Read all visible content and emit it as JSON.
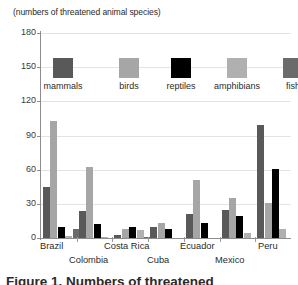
{
  "units_caption": "(numbers of threatened animal species)",
  "bottom_caption": "Figure 1. Numbers of threatened",
  "legend": {
    "items": [
      {
        "label": "mammals",
        "color": "#595959"
      },
      {
        "label": "birds",
        "color": "#a6a6a6"
      },
      {
        "label": "reptiles",
        "color": "#000000"
      },
      {
        "label": "amphibians",
        "color": "#b0b0b0"
      },
      {
        "label": "fish",
        "color": "#6b6b6b"
      }
    ]
  },
  "axis": {
    "y_ticks": [
      "0",
      "30",
      "60",
      "90",
      "120",
      "150",
      "180"
    ],
    "y_min": 0,
    "y_max": 180
  },
  "chart_data": {
    "type": "bar",
    "title": "",
    "subtitle": "(numbers of threatened animal species)",
    "xlabel": "",
    "ylabel": "",
    "ylim": [
      0,
      180
    ],
    "ytick_step": 30,
    "grid": true,
    "legend_position": "inside-top",
    "categories": [
      "Brazil",
      "Colombia",
      "Costa Rica",
      "Cuba",
      "Ecuador",
      "Mexico",
      "Peru"
    ],
    "series": [
      {
        "name": "mammals",
        "color": "#595959",
        "values": [
          45,
          24,
          3,
          10,
          21,
          25,
          99
        ]
      },
      {
        "name": "birds",
        "color": "#a6a6a6",
        "values": [
          103,
          62,
          8,
          13,
          51,
          35,
          31
        ]
      },
      {
        "name": "reptiles",
        "color": "#000000",
        "values": [
          10,
          12,
          10,
          8,
          13,
          19,
          61
        ]
      },
      {
        "name": "amphibians",
        "color": "#b0b0b0",
        "values": [
          2,
          1,
          7,
          0,
          0,
          4,
          8
        ]
      },
      {
        "name": "fish",
        "color": "#6b6b6b",
        "values": [
          8,
          0,
          1,
          0,
          0,
          0,
          0
        ]
      }
    ]
  },
  "x_labels": [
    {
      "text": "Brazil",
      "row": 1,
      "left": 40
    },
    {
      "text": "Colombia",
      "row": 2,
      "left": 69
    },
    {
      "text": "Costa Rica",
      "row": 1,
      "left": 104
    },
    {
      "text": "Cuba",
      "row": 2,
      "left": 147
    },
    {
      "text": "Ecuador",
      "row": 1,
      "left": 180
    },
    {
      "text": "Mexico",
      "row": 2,
      "left": 215
    },
    {
      "text": "Peru",
      "row": 1,
      "left": 258
    }
  ]
}
